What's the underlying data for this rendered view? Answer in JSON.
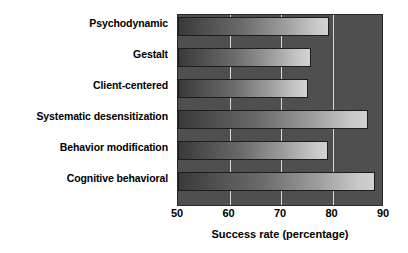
{
  "chart_data": {
    "type": "bar",
    "orientation": "horizontal",
    "title": "",
    "subtitle": "",
    "xlabel": "Success rate (percentage)",
    "ylabel": "",
    "categories": [
      "Psychodynamic",
      "Gestalt",
      "Client-centered",
      "Systematic desensitization",
      "Behavior modification",
      "Cognitive behavioral"
    ],
    "values": [
      79.7,
      76.0,
      75.5,
      87.3,
      79.5,
      88.6
    ],
    "xlim": [
      50,
      90
    ],
    "xticks": [
      50,
      60,
      70,
      80,
      90
    ],
    "xtick_labels": [
      "50",
      "60",
      "70",
      "80",
      "90"
    ],
    "gridlines_x": [
      60,
      70,
      80
    ],
    "grid": true,
    "legend": false,
    "legend_position": "none",
    "annotations": []
  },
  "style": {
    "plot_background": "#4f4f4f",
    "page_background": "#ffffff",
    "gridline_color": "#d8d8d8",
    "bar_gradient_start": "#3a3a3a",
    "bar_gradient_end": "#d2d2d2",
    "bar_border": "#1c1c1c",
    "text_color": "#000000"
  }
}
